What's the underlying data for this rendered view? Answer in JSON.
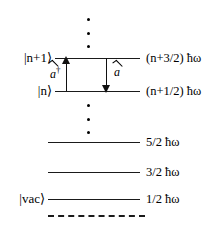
{
  "figure": {
    "type": "quantum-harmonic-oscillator-energy-level-diagram",
    "background_color": "#ffffff",
    "line_color": "#1a1a1a"
  },
  "levels": [
    {
      "id": "n-plus-1",
      "ket_label": "|n+1⟩",
      "energy_label": "(n+3/2) ħω"
    },
    {
      "id": "n",
      "ket_label": "|n⟩",
      "energy_label": "(n+1/2) ħω"
    },
    {
      "id": "two",
      "ket_label": "",
      "energy_label": "5/2 ħω"
    },
    {
      "id": "one",
      "ket_label": "",
      "energy_label": "3/2 ħω"
    },
    {
      "id": "vacuum",
      "ket_label": "|vac⟩",
      "energy_label": "1/2 ħω"
    }
  ],
  "operators": {
    "creation": {
      "label": "a",
      "dagger": "†",
      "direction": "up",
      "name": "creation-operator"
    },
    "annihilation": {
      "label": "a",
      "dagger": "",
      "direction": "down",
      "name": "annihilation-operator"
    }
  },
  "ellipses": [
    {
      "id": "upper",
      "dot_count": 3
    },
    {
      "id": "lower",
      "dot_count": 3
    }
  ]
}
